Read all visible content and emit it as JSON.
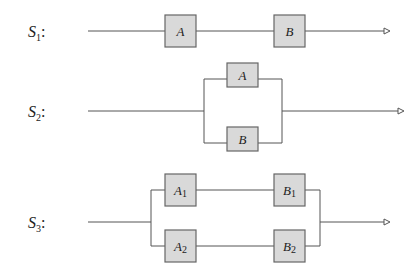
{
  "systems": [
    {
      "id": "S1",
      "label": "S",
      "label_sub": "1",
      "colon": ":",
      "configuration": "series",
      "components": [
        {
          "name": "A",
          "sub": ""
        },
        {
          "name": "B",
          "sub": ""
        }
      ]
    },
    {
      "id": "S2",
      "label": "S",
      "label_sub": "2",
      "colon": ":",
      "configuration": "parallel",
      "components": [
        {
          "name": "A",
          "sub": ""
        },
        {
          "name": "B",
          "sub": ""
        }
      ]
    },
    {
      "id": "S3",
      "label": "S",
      "label_sub": "3",
      "colon": ":",
      "configuration": "parallel-of-series",
      "components": [
        {
          "name": "A",
          "sub": "1"
        },
        {
          "name": "B",
          "sub": "1"
        },
        {
          "name": "A",
          "sub": "2"
        },
        {
          "name": "B",
          "sub": "2"
        }
      ]
    }
  ],
  "colors": {
    "box_fill": "#d9d9d9",
    "box_stroke": "#666666",
    "wire": "#555555"
  }
}
